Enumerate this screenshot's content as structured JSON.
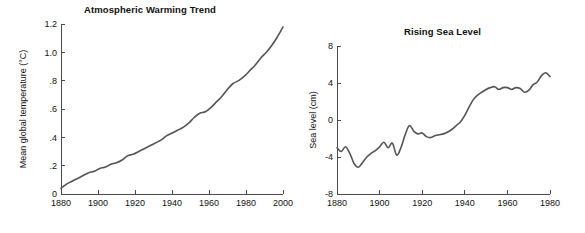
{
  "figure": {
    "background": "#ffffff",
    "line_color": "#555555",
    "axis_color": "#4a4a4a",
    "text_color": "#111111"
  },
  "chart_data": [
    {
      "type": "line",
      "id": "atmospheric-warming-trend",
      "title": "Atmospheric Warming Trend",
      "xlabel": "",
      "ylabel": "Mean global temperature (°C)",
      "xlim": [
        1880,
        2000
      ],
      "ylim": [
        0,
        1.2
      ],
      "grid": false,
      "legend": "none",
      "xticks": [
        1880,
        1900,
        1920,
        1940,
        1960,
        1980,
        2000
      ],
      "xticklabels": [
        "1880",
        "1900",
        "1920",
        "1940",
        "1960",
        "1980",
        "2000"
      ],
      "yticks": [
        0,
        0.2,
        0.4,
        0.6,
        0.8,
        1.0,
        1.2
      ],
      "yticklabels": [
        "0",
        ".2",
        ".4",
        ".6",
        ".8",
        "1.0",
        "1.2"
      ],
      "series": [
        {
          "name": "Mean global temperature",
          "x": [
            1880,
            1883,
            1886,
            1889,
            1892,
            1895,
            1898,
            1901,
            1904,
            1907,
            1910,
            1913,
            1916,
            1919,
            1922,
            1925,
            1928,
            1931,
            1934,
            1937,
            1940,
            1943,
            1946,
            1949,
            1952,
            1955,
            1958,
            1961,
            1964,
            1967,
            1970,
            1973,
            1976,
            1979,
            1982,
            1985,
            1988,
            1991,
            1994,
            1997,
            2000
          ],
          "values": [
            0.04,
            0.07,
            0.09,
            0.11,
            0.13,
            0.15,
            0.16,
            0.18,
            0.19,
            0.21,
            0.22,
            0.24,
            0.27,
            0.28,
            0.3,
            0.32,
            0.34,
            0.36,
            0.38,
            0.41,
            0.43,
            0.45,
            0.47,
            0.5,
            0.54,
            0.57,
            0.58,
            0.61,
            0.65,
            0.69,
            0.74,
            0.78,
            0.8,
            0.83,
            0.87,
            0.91,
            0.96,
            1.0,
            1.05,
            1.11,
            1.18
          ]
        }
      ]
    },
    {
      "type": "line",
      "id": "rising-sea-level",
      "title": "Rising Sea Level",
      "xlabel": "",
      "ylabel": "Sea level (cm)",
      "xlim": [
        1880,
        1980
      ],
      "ylim": [
        -8,
        8
      ],
      "grid": false,
      "legend": "none",
      "xticks": [
        1880,
        1900,
        1920,
        1940,
        1960,
        1980
      ],
      "xticklabels": [
        "1880",
        "1900",
        "1920",
        "1940",
        "1960",
        "1980"
      ],
      "yticks": [
        -8,
        -4,
        0,
        4,
        8
      ],
      "yticklabels": [
        "-8",
        "-4",
        "0",
        "4",
        "8"
      ],
      "series": [
        {
          "name": "Sea level",
          "x": [
            1880,
            1882,
            1884,
            1886,
            1888,
            1890,
            1892,
            1894,
            1896,
            1898,
            1900,
            1902,
            1904,
            1906,
            1908,
            1910,
            1912,
            1914,
            1916,
            1918,
            1920,
            1922,
            1924,
            1926,
            1928,
            1930,
            1932,
            1934,
            1936,
            1938,
            1940,
            1942,
            1944,
            1946,
            1948,
            1950,
            1952,
            1954,
            1956,
            1958,
            1960,
            1962,
            1964,
            1966,
            1968,
            1970,
            1972,
            1974,
            1976,
            1978,
            1980
          ],
          "values": [
            -3.0,
            -3.4,
            -2.9,
            -3.6,
            -4.7,
            -5.1,
            -4.6,
            -4.0,
            -3.6,
            -3.3,
            -2.9,
            -2.4,
            -3.0,
            -2.5,
            -3.8,
            -3.0,
            -1.6,
            -0.6,
            -1.2,
            -1.5,
            -1.4,
            -1.8,
            -1.9,
            -1.7,
            -1.6,
            -1.5,
            -1.3,
            -1.0,
            -0.6,
            -0.2,
            0.5,
            1.4,
            2.2,
            2.7,
            3.0,
            3.3,
            3.5,
            3.6,
            3.3,
            3.5,
            3.5,
            3.3,
            3.5,
            3.4,
            3.0,
            3.2,
            3.8,
            4.1,
            4.8,
            5.1,
            4.7
          ]
        }
      ]
    }
  ],
  "left_chart_geometry": {
    "plot_left": 61,
    "plot_right": 283,
    "plot_top": 24,
    "plot_bottom": 194
  },
  "right_chart_geometry": {
    "plot_left": 37,
    "plot_right": 250,
    "plot_top": 46,
    "plot_bottom": 194
  }
}
